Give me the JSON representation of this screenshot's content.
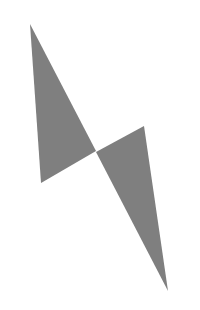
{
  "figure": {
    "background": "#ffffff",
    "fill": "#7f7f7f",
    "shapes": [
      {
        "name": "upper-triangle",
        "points": "30,24 41,183 96,151"
      },
      {
        "name": "lower-triangle",
        "points": "96,152 144,126 168,291"
      }
    ]
  }
}
